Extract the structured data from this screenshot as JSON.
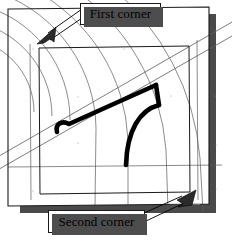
{
  "figure": {
    "type": "technical-illustration",
    "background_color": "#ffffff",
    "ink_color": "#000000",
    "construction_line_color": "#555555",
    "shadow_color": "#4d4d4d",
    "thick_outline_color": "#000000",
    "callouts": [
      {
        "id": "first-corner",
        "label": "First corner",
        "arrow": "points down-left to outer frame top-left corner"
      },
      {
        "id": "second-corner",
        "label": "Second corner",
        "arrow": "points up-right to inner frame bottom-right corner"
      }
    ],
    "elements": {
      "outer_frame": "outer tilted rectangle border",
      "inner_frame": "inner tilted rectangle border",
      "arcs": "family of concentric construction arcs",
      "rails": "pair of parallel diagonal construction lines",
      "profile": "thick black bent L profile with fillet curve",
      "drop_shadow": "dark gray offset shadow on right and bottom edges"
    }
  }
}
